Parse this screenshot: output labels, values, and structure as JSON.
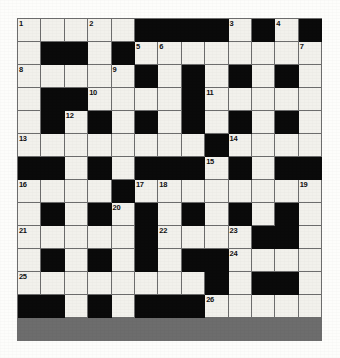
{
  "puzzle": {
    "type": "crossword-grid",
    "title": "",
    "rows": 14,
    "cols": 13,
    "cell_size_px": 23.4,
    "colors": {
      "white_cell": "#f2f1ec",
      "black_cell": "#0a0a0a",
      "grid_line": "#6d6d6d",
      "number_text": "#101010",
      "page_background": "#fdfdfb"
    },
    "legend": {
      "white": "open letter square",
      "black": "blocked square"
    },
    "max_clue_number": 26,
    "clue_numbers_present": [
      1,
      2,
      3,
      4,
      5,
      6,
      7,
      8,
      9,
      10,
      11,
      12,
      13,
      14,
      15,
      16,
      17,
      18,
      19,
      20,
      21,
      22,
      23,
      24,
      25,
      26
    ],
    "grid": [
      [
        "1",
        "2",
        "3",
        "4",
        "5",
        "#",
        "#",
        "#",
        "#",
        "6",
        "#",
        "7",
        "#"
      ],
      [
        "8",
        "#",
        "#",
        "9",
        "#",
        "10",
        "11",
        "12",
        "13",
        "14",
        "15",
        "16",
        "17"
      ],
      [
        "18",
        "19",
        "20",
        "21",
        "22",
        "#",
        "23",
        "#",
        "24",
        "#",
        "25",
        "#",
        "26"
      ],
      [
        "27",
        "#",
        "#",
        "28",
        "29",
        "30",
        "31",
        "#",
        "32",
        "33",
        "34",
        "35",
        "36"
      ],
      [
        "37",
        "#",
        "38",
        "#",
        "39",
        "#",
        "40",
        "#",
        "41",
        "#",
        "42",
        "#",
        "43"
      ],
      [
        "44",
        "45",
        "46",
        "47",
        "48",
        "49",
        "50",
        "51",
        "#",
        "52",
        "53",
        "54",
        "55"
      ],
      [
        "#",
        "#",
        "56",
        "#",
        "57",
        "#",
        "#",
        "#",
        "58",
        "#",
        "59",
        "#",
        "#"
      ],
      [
        "60",
        "61",
        "62",
        "63",
        "#",
        "64",
        "65",
        "66",
        "67",
        "68",
        "69",
        "70",
        "71"
      ],
      [
        "72",
        "#",
        "73",
        "#",
        "74",
        "#",
        "75",
        "#",
        "76",
        "#",
        "77",
        "#",
        "78"
      ],
      [
        "79",
        "80",
        "81",
        "82",
        "83",
        "#",
        "84",
        "85",
        "86",
        "87",
        "#",
        "#",
        "88"
      ],
      [
        "89",
        "#",
        "90",
        "#",
        "91",
        "#",
        "92",
        "#",
        "#",
        "93",
        "94",
        "95",
        "96"
      ],
      [
        "97",
        "#",
        "98",
        "#",
        "99",
        "#",
        "100",
        "#",
        "101",
        "102",
        "103",
        "104",
        "105"
      ],
      [
        "106",
        "107",
        "108",
        "109",
        "110",
        "111",
        "112",
        "113",
        "#",
        "114",
        "#",
        "#",
        "115"
      ],
      [
        "#",
        "#",
        "116",
        "#",
        "117",
        "#",
        "#",
        "#",
        "118",
        "119",
        "120",
        "121",
        "122"
      ]
    ],
    "cells": [
      [
        {
          "black": false,
          "num": "1"
        },
        {
          "black": false,
          "num": ""
        },
        {
          "black": false,
          "num": ""
        },
        {
          "black": false,
          "num": "2"
        },
        {
          "black": false,
          "num": ""
        },
        {
          "black": true,
          "num": ""
        },
        {
          "black": true,
          "num": ""
        },
        {
          "black": true,
          "num": ""
        },
        {
          "black": true,
          "num": ""
        },
        {
          "black": false,
          "num": "3"
        },
        {
          "black": true,
          "num": ""
        },
        {
          "black": false,
          "num": "4"
        },
        {
          "black": true,
          "num": ""
        }
      ],
      [
        {
          "black": false,
          "num": ""
        },
        {
          "black": true,
          "num": ""
        },
        {
          "black": true,
          "num": ""
        },
        {
          "black": false,
          "num": ""
        },
        {
          "black": true,
          "num": ""
        },
        {
          "black": false,
          "num": "5"
        },
        {
          "black": false,
          "num": "6"
        },
        {
          "black": false,
          "num": ""
        },
        {
          "black": false,
          "num": ""
        },
        {
          "black": false,
          "num": ""
        },
        {
          "black": false,
          "num": ""
        },
        {
          "black": false,
          "num": ""
        },
        {
          "black": false,
          "num": "7"
        }
      ],
      [
        {
          "black": false,
          "num": "8"
        },
        {
          "black": false,
          "num": ""
        },
        {
          "black": false,
          "num": ""
        },
        {
          "black": false,
          "num": ""
        },
        {
          "black": false,
          "num": "9"
        },
        {
          "black": true,
          "num": ""
        },
        {
          "black": false,
          "num": ""
        },
        {
          "black": true,
          "num": ""
        },
        {
          "black": false,
          "num": ""
        },
        {
          "black": true,
          "num": ""
        },
        {
          "black": false,
          "num": ""
        },
        {
          "black": true,
          "num": ""
        },
        {
          "black": false,
          "num": ""
        }
      ],
      [
        {
          "black": false,
          "num": ""
        },
        {
          "black": true,
          "num": ""
        },
        {
          "black": true,
          "num": ""
        },
        {
          "black": false,
          "num": "10"
        },
        {
          "black": false,
          "num": ""
        },
        {
          "black": false,
          "num": ""
        },
        {
          "black": false,
          "num": ""
        },
        {
          "black": true,
          "num": ""
        },
        {
          "black": false,
          "num": "11"
        },
        {
          "black": false,
          "num": ""
        },
        {
          "black": false,
          "num": ""
        },
        {
          "black": false,
          "num": ""
        },
        {
          "black": false,
          "num": ""
        }
      ],
      [
        {
          "black": false,
          "num": ""
        },
        {
          "black": true,
          "num": ""
        },
        {
          "black": false,
          "num": "12"
        },
        {
          "black": true,
          "num": ""
        },
        {
          "black": false,
          "num": ""
        },
        {
          "black": true,
          "num": ""
        },
        {
          "black": false,
          "num": ""
        },
        {
          "black": true,
          "num": ""
        },
        {
          "black": false,
          "num": ""
        },
        {
          "black": true,
          "num": ""
        },
        {
          "black": false,
          "num": ""
        },
        {
          "black": true,
          "num": ""
        },
        {
          "black": false,
          "num": ""
        }
      ],
      [
        {
          "black": false,
          "num": "13"
        },
        {
          "black": false,
          "num": ""
        },
        {
          "black": false,
          "num": ""
        },
        {
          "black": false,
          "num": ""
        },
        {
          "black": false,
          "num": ""
        },
        {
          "black": false,
          "num": ""
        },
        {
          "black": false,
          "num": ""
        },
        {
          "black": false,
          "num": ""
        },
        {
          "black": true,
          "num": ""
        },
        {
          "black": false,
          "num": "14"
        },
        {
          "black": false,
          "num": ""
        },
        {
          "black": false,
          "num": ""
        },
        {
          "black": false,
          "num": ""
        }
      ],
      [
        {
          "black": true,
          "num": ""
        },
        {
          "black": true,
          "num": ""
        },
        {
          "black": false,
          "num": ""
        },
        {
          "black": true,
          "num": ""
        },
        {
          "black": false,
          "num": ""
        },
        {
          "black": true,
          "num": ""
        },
        {
          "black": true,
          "num": ""
        },
        {
          "black": true,
          "num": ""
        },
        {
          "black": false,
          "num": "15"
        },
        {
          "black": true,
          "num": ""
        },
        {
          "black": false,
          "num": ""
        },
        {
          "black": true,
          "num": ""
        },
        {
          "black": true,
          "num": ""
        }
      ],
      [
        {
          "black": false,
          "num": "16"
        },
        {
          "black": false,
          "num": ""
        },
        {
          "black": false,
          "num": ""
        },
        {
          "black": false,
          "num": ""
        },
        {
          "black": true,
          "num": ""
        },
        {
          "black": false,
          "num": "17"
        },
        {
          "black": false,
          "num": "18"
        },
        {
          "black": false,
          "num": ""
        },
        {
          "black": false,
          "num": ""
        },
        {
          "black": false,
          "num": ""
        },
        {
          "black": false,
          "num": ""
        },
        {
          "black": false,
          "num": ""
        },
        {
          "black": false,
          "num": "19"
        }
      ],
      [
        {
          "black": false,
          "num": ""
        },
        {
          "black": true,
          "num": ""
        },
        {
          "black": false,
          "num": ""
        },
        {
          "black": true,
          "num": ""
        },
        {
          "black": false,
          "num": "20"
        },
        {
          "black": true,
          "num": ""
        },
        {
          "black": false,
          "num": ""
        },
        {
          "black": true,
          "num": ""
        },
        {
          "black": false,
          "num": ""
        },
        {
          "black": true,
          "num": ""
        },
        {
          "black": false,
          "num": ""
        },
        {
          "black": true,
          "num": ""
        },
        {
          "black": false,
          "num": ""
        }
      ],
      [
        {
          "black": false,
          "num": "21"
        },
        {
          "black": false,
          "num": ""
        },
        {
          "black": false,
          "num": ""
        },
        {
          "black": false,
          "num": ""
        },
        {
          "black": false,
          "num": ""
        },
        {
          "black": true,
          "num": ""
        },
        {
          "black": false,
          "num": "22"
        },
        {
          "black": false,
          "num": ""
        },
        {
          "black": false,
          "num": ""
        },
        {
          "black": false,
          "num": "23"
        },
        {
          "black": true,
          "num": ""
        },
        {
          "black": true,
          "num": ""
        },
        {
          "black": false,
          "num": ""
        }
      ],
      [
        {
          "black": false,
          "num": ""
        },
        {
          "black": true,
          "num": ""
        },
        {
          "black": false,
          "num": ""
        },
        {
          "black": true,
          "num": ""
        },
        {
          "black": false,
          "num": ""
        },
        {
          "black": true,
          "num": ""
        },
        {
          "black": false,
          "num": ""
        },
        {
          "black": true,
          "num": ""
        },
        {
          "black": true,
          "num": ""
        },
        {
          "black": false,
          "num": "24"
        },
        {
          "black": false,
          "num": ""
        },
        {
          "black": false,
          "num": ""
        },
        {
          "black": false,
          "num": ""
        }
      ],
      [
        {
          "black": false,
          "num": "25"
        },
        {
          "black": false,
          "num": ""
        },
        {
          "black": false,
          "num": ""
        },
        {
          "black": false,
          "num": ""
        },
        {
          "black": false,
          "num": ""
        },
        {
          "black": false,
          "num": ""
        },
        {
          "black": false,
          "num": ""
        },
        {
          "black": false,
          "num": ""
        },
        {
          "black": true,
          "num": ""
        },
        {
          "black": false,
          "num": ""
        },
        {
          "black": true,
          "num": ""
        },
        {
          "black": true,
          "num": ""
        },
        {
          "black": false,
          "num": ""
        }
      ],
      [
        {
          "black": true,
          "num": ""
        },
        {
          "black": true,
          "num": ""
        },
        {
          "black": false,
          "num": ""
        },
        {
          "black": true,
          "num": ""
        },
        {
          "black": false,
          "num": ""
        },
        {
          "black": true,
          "num": ""
        },
        {
          "black": true,
          "num": ""
        },
        {
          "black": true,
          "num": ""
        },
        {
          "black": false,
          "num": "26"
        },
        {
          "black": false,
          "num": ""
        },
        {
          "black": false,
          "num": ""
        },
        {
          "black": false,
          "num": ""
        },
        {
          "black": false,
          "num": ""
        }
      ]
    ]
  }
}
